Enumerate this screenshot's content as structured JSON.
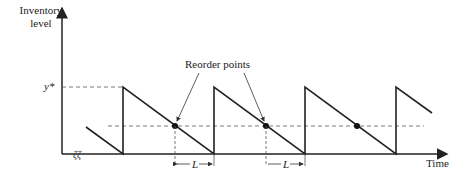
{
  "diagram": {
    "y_axis_label_line1": "Inventory",
    "y_axis_label_line2": "level",
    "x_axis_label": "Time",
    "y_star_label": "y*",
    "annotation": "Reorder points",
    "lead_time_label": "L",
    "colors": {
      "line": "#222222",
      "dash": "#555555"
    }
  }
}
